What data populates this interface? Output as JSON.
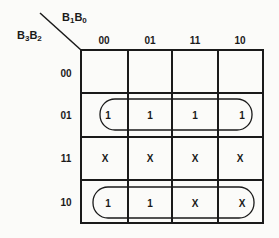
{
  "kmap": {
    "col_var": {
      "a": "B",
      "a_sub": "1",
      "b": "B",
      "b_sub": "0"
    },
    "row_var": {
      "a": "B",
      "a_sub": "3",
      "b": "B",
      "b_sub": "2"
    },
    "col_headers": [
      "00",
      "01",
      "11",
      "10"
    ],
    "row_headers": [
      "00",
      "01",
      "11",
      "10"
    ],
    "cells": [
      [
        "",
        "",
        "",
        ""
      ],
      [
        "1",
        "1",
        "1",
        "1"
      ],
      [
        "X",
        "X",
        "X",
        "X"
      ],
      [
        "1",
        "1",
        "X",
        "X"
      ]
    ],
    "groups": [
      {
        "row": 1,
        "from_col": 0,
        "to_col": 3,
        "label": "row-01 group"
      },
      {
        "row": 3,
        "from_col": 0,
        "to_col": 3,
        "label": "row-10 group"
      }
    ]
  }
}
